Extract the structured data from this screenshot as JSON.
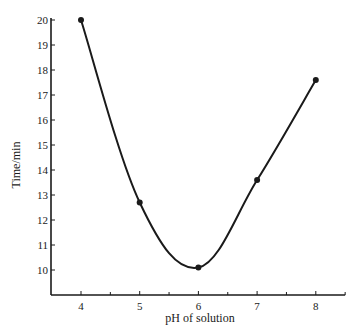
{
  "chart_data": {
    "type": "line",
    "title": "",
    "xlabel": "pH of solution",
    "ylabel": "Time/min",
    "x": [
      4,
      5,
      6,
      7,
      8
    ],
    "series": [
      {
        "name": "Time",
        "values": [
          20.0,
          12.7,
          10.1,
          13.6,
          17.6
        ],
        "smooth": true,
        "markers": true
      }
    ],
    "xlim": [
      3.5,
      8.5
    ],
    "ylim": [
      9,
      20
    ],
    "xticks": [
      4,
      5,
      6,
      7,
      8
    ],
    "xminor_ticks": [
      4.5,
      5.5,
      6.5,
      7.5,
      8.5
    ],
    "yticks": [
      10,
      11,
      12,
      13,
      14,
      15,
      16,
      17,
      18,
      19,
      20
    ],
    "grid": false,
    "legend": null
  },
  "style": {
    "line_color": "#1a1a1a",
    "axis_color": "#1a1a1a",
    "background": "#ffffff"
  }
}
